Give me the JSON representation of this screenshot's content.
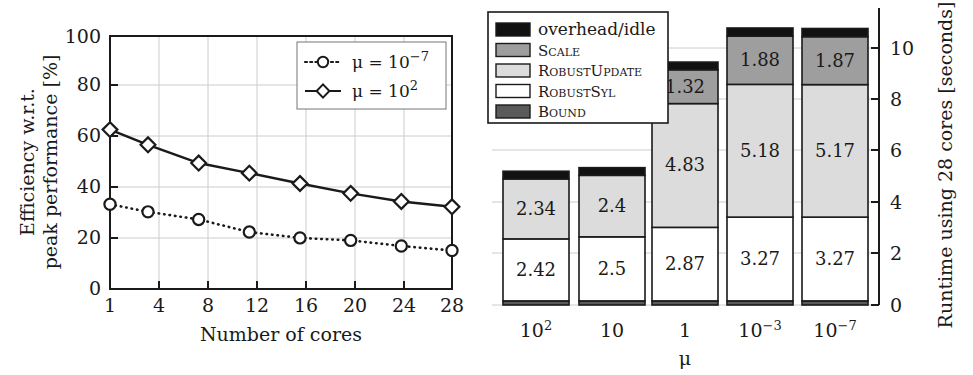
{
  "figure": {
    "panels": [
      "efficiency-line-chart",
      "runtime-stacked-bar-chart"
    ]
  },
  "chart_data": [
    {
      "id": "efficiency",
      "type": "line",
      "title": "",
      "xlabel": "Number of cores",
      "ylabel": "Efficiency w.r.t. peak performance [%]",
      "ylabel_line1": "Efficiency w.r.t.",
      "ylabel_line2": "peak performance [%]",
      "x": [
        1,
        4,
        8,
        12,
        16,
        20,
        24,
        28
      ],
      "xticklabels": [
        "1",
        "4",
        "8",
        "12",
        "16",
        "20",
        "24",
        "28"
      ],
      "yticklabels": [
        "0",
        "20",
        "40",
        "60",
        "80",
        "100"
      ],
      "yticks": [
        0,
        20,
        40,
        60,
        80,
        100
      ],
      "ylim": [
        0,
        100
      ],
      "xlim": [
        1,
        28
      ],
      "grid": true,
      "legend_position": "top-right",
      "series": [
        {
          "name": "mu = 10^-7",
          "legend_base": "μ = 10",
          "legend_exp": "−7",
          "marker": "circle",
          "linestyle": "dotted",
          "values": [
            33.5,
            30.5,
            27.5,
            22.5,
            20.2,
            19.2,
            17.0,
            15.2
          ]
        },
        {
          "name": "mu = 10^2",
          "legend_base": "μ = 10",
          "legend_exp": "2",
          "marker": "diamond",
          "linestyle": "solid",
          "values": [
            63.0,
            57.0,
            49.8,
            45.8,
            41.7,
            37.8,
            34.6,
            32.5
          ]
        }
      ]
    },
    {
      "id": "runtime",
      "type": "bar",
      "stacked": true,
      "title": "",
      "xlabel": "μ",
      "ylabel": "Runtime using 28 cores [seconds]",
      "categories": [
        "10^2",
        "10",
        "1",
        "10^-3",
        "10^-7"
      ],
      "category_labels": [
        {
          "base": "10",
          "exp": "2"
        },
        {
          "base": "10",
          "exp": ""
        },
        {
          "base": "1",
          "exp": ""
        },
        {
          "base": "10",
          "exp": "−3"
        },
        {
          "base": "10",
          "exp": "−7"
        }
      ],
      "yticklabels": [
        "0",
        "2",
        "4",
        "6",
        "8",
        "10"
      ],
      "yticks": [
        0,
        2,
        4,
        6,
        8,
        10
      ],
      "ylim": [
        0,
        11.2
      ],
      "grid": true,
      "legend_position": "top-left",
      "segment_order_bottom_to_top": [
        "Bound",
        "RobustSyl",
        "RobustUpdate",
        "Scale",
        "overhead/idle"
      ],
      "legend_entries": [
        {
          "label": "overhead/idle",
          "color": "#111111",
          "style": "normal"
        },
        {
          "label": "Scale",
          "color": "#9e9e9e",
          "style": "smallcaps"
        },
        {
          "label": "RobustUpdate",
          "color": "#dcdcdc",
          "style": "smallcaps"
        },
        {
          "label": "RobustSyl",
          "color": "#ffffff",
          "style": "smallcaps"
        },
        {
          "label": "Bound",
          "color": "#5a5a5a",
          "style": "smallcaps"
        }
      ],
      "series": [
        {
          "name": "Bound",
          "color": "#5a5a5a",
          "values": [
            0.16,
            0.16,
            0.16,
            0.16,
            0.16
          ],
          "labels": [
            "",
            "",
            "",
            "",
            ""
          ]
        },
        {
          "name": "RobustSyl",
          "color": "#ffffff",
          "values": [
            2.42,
            2.5,
            2.87,
            3.27,
            3.27
          ],
          "labels": [
            "2.42",
            "2.5",
            "2.87",
            "3.27",
            "3.27"
          ]
        },
        {
          "name": "RobustUpdate",
          "color": "#dcdcdc",
          "values": [
            2.34,
            2.4,
            4.83,
            5.18,
            5.17
          ],
          "labels": [
            "2.34",
            "2.4",
            "4.83",
            "5.18",
            "5.17"
          ]
        },
        {
          "name": "Scale",
          "color": "#9e9e9e",
          "values": [
            0.0,
            0.0,
            1.32,
            1.88,
            1.87
          ],
          "labels": [
            "",
            "",
            "1.32",
            "1.88",
            "1.87"
          ]
        },
        {
          "name": "overhead/idle",
          "color": "#111111",
          "values": [
            0.3,
            0.3,
            0.3,
            0.32,
            0.32
          ],
          "labels": [
            "",
            "",
            "",
            "",
            ""
          ]
        }
      ],
      "totals": [
        5.22,
        5.36,
        9.48,
        10.81,
        10.79
      ]
    }
  ]
}
